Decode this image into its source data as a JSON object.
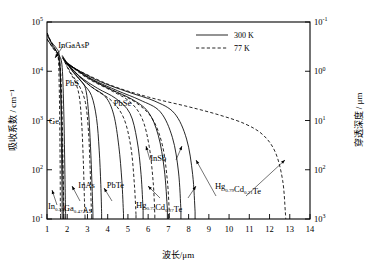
{
  "chart_data": {
    "type": "line",
    "title": "",
    "xlabel": "波长/μm",
    "ylabel": "吸收系数 / cm⁻¹",
    "y2label": "穿透深度 / μm",
    "xlim": [
      1,
      14
    ],
    "ylim": [
      10,
      100000
    ],
    "y2lim": [
      1000,
      0.1
    ],
    "yscale": "log",
    "xscale": "linear",
    "grid": false,
    "xticks": [
      "1",
      "2",
      "3",
      "4",
      "5",
      "6",
      "7",
      "8",
      "9",
      "10",
      "11",
      "12",
      "13",
      "14"
    ],
    "yticks": [
      "10¹",
      "10²",
      "10³",
      "10⁴",
      "10⁵"
    ],
    "yticks_mantissa": [
      "10",
      "10",
      "10",
      "10",
      "10"
    ],
    "yticks_exponent": [
      "1",
      "2",
      "3",
      "4",
      "5"
    ],
    "y2ticks_mantissa": [
      "10",
      "10",
      "10",
      "10",
      "10"
    ],
    "y2ticks_exponent": [
      "-1",
      "0",
      "1",
      "2",
      "3"
    ],
    "legend": {
      "position": "top-right",
      "entries": [
        {
          "label": "300 K",
          "style": "solid"
        },
        {
          "label": "77 K",
          "style": "dashed"
        }
      ]
    },
    "annotations": [
      {
        "label": "InGaAsP",
        "x": 1.55,
        "y": 30000
      },
      {
        "label": "PbS",
        "x": 1.9,
        "y": 5000
      },
      {
        "label": "Ge",
        "x": 1.1,
        "y": 850
      },
      {
        "label": "PbSe",
        "x": 4.3,
        "y": 2000
      },
      {
        "label": "PbTe",
        "x": 3.95,
        "y": 42
      },
      {
        "label": "InAs",
        "x": 2.55,
        "y": 42
      },
      {
        "label": "InSb",
        "x": 6.1,
        "y": 150
      },
      {
        "label": "In₀.₅₃Ga₀.₄₇As",
        "x": 1.05,
        "y": 16
      },
      {
        "label": "Hg₀.₇₃Cd₀.₂₇Te",
        "x": 5.4,
        "y": 17
      },
      {
        "label": "Hg₀.₇₉Cd₀.₂₁Te",
        "x": 9.3,
        "y": 40
      }
    ],
    "series": [
      {
        "name": "In0.53Ga0.47As",
        "temperature": "300 K",
        "style": "solid",
        "points": [
          [
            1.0,
            60000
          ],
          [
            1.2,
            40000
          ],
          [
            1.45,
            30000
          ],
          [
            1.6,
            22000
          ],
          [
            1.66,
            9000
          ],
          [
            1.7,
            1200
          ],
          [
            1.72,
            200
          ],
          [
            1.74,
            40
          ],
          [
            1.75,
            12
          ]
        ]
      },
      {
        "name": "In0.53Ga0.47As",
        "temperature": "77 K",
        "style": "dashed",
        "points": [
          [
            1.0,
            60000
          ],
          [
            1.2,
            40000
          ],
          [
            1.4,
            28000
          ],
          [
            1.55,
            20000
          ],
          [
            1.6,
            6000
          ],
          [
            1.63,
            900
          ],
          [
            1.65,
            120
          ],
          [
            1.66,
            20
          ],
          [
            1.67,
            11
          ]
        ]
      },
      {
        "name": "Ge",
        "temperature": "300 K",
        "style": "solid",
        "points": [
          [
            1.0,
            45000
          ],
          [
            1.3,
            30000
          ],
          [
            1.6,
            21000
          ],
          [
            1.75,
            12000
          ],
          [
            1.83,
            1500
          ],
          [
            1.87,
            200
          ],
          [
            1.9,
            35
          ],
          [
            1.92,
            12
          ]
        ]
      },
      {
        "name": "Ge",
        "temperature": "77 K",
        "style": "dashed",
        "points": [
          [
            1.0,
            45000
          ],
          [
            1.3,
            29000
          ],
          [
            1.55,
            20000
          ],
          [
            1.68,
            9000
          ],
          [
            1.75,
            1200
          ],
          [
            1.79,
            160
          ],
          [
            1.82,
            30
          ],
          [
            1.84,
            11
          ]
        ]
      },
      {
        "name": "InGaAsP",
        "temperature": "300 K",
        "style": "solid",
        "points": [
          [
            1.0,
            55000
          ],
          [
            1.25,
            35000
          ],
          [
            1.5,
            24000
          ],
          [
            1.62,
            14000
          ],
          [
            1.7,
            2500
          ],
          [
            1.75,
            350
          ],
          [
            1.79,
            50
          ],
          [
            1.81,
            13
          ]
        ]
      },
      {
        "name": "PbS",
        "temperature": "300 K",
        "style": "solid",
        "points": [
          [
            1.75,
            21000
          ],
          [
            2.2,
            11000
          ],
          [
            2.6,
            7000
          ],
          [
            2.9,
            4500
          ],
          [
            3.05,
            1500
          ],
          [
            3.15,
            300
          ],
          [
            3.22,
            55
          ],
          [
            3.27,
            13
          ]
        ]
      },
      {
        "name": "PbS",
        "temperature": "77 K",
        "style": "dashed",
        "points": [
          [
            1.75,
            20000
          ],
          [
            2.1,
            10000
          ],
          [
            2.4,
            6000
          ],
          [
            2.6,
            3000
          ],
          [
            2.72,
            800
          ],
          [
            2.8,
            130
          ],
          [
            2.85,
            25
          ],
          [
            2.88,
            11
          ]
        ]
      },
      {
        "name": "InAs",
        "temperature": "300 K",
        "style": "solid",
        "points": [
          [
            1.78,
            19000
          ],
          [
            2.3,
            9500
          ],
          [
            2.8,
            5500
          ],
          [
            3.2,
            3200
          ],
          [
            3.45,
            1100
          ],
          [
            3.58,
            250
          ],
          [
            3.66,
            50
          ],
          [
            3.7,
            13
          ]
        ]
      },
      {
        "name": "InAs",
        "temperature": "77 K",
        "style": "dashed",
        "points": [
          [
            1.78,
            18500
          ],
          [
            2.2,
            9000
          ],
          [
            2.6,
            5000
          ],
          [
            2.9,
            2300
          ],
          [
            3.05,
            600
          ],
          [
            3.13,
            110
          ],
          [
            3.18,
            22
          ],
          [
            3.21,
            11
          ]
        ]
      },
      {
        "name": "PbTe",
        "temperature": "300 K",
        "style": "solid",
        "points": [
          [
            1.8,
            18000
          ],
          [
            2.5,
            8500
          ],
          [
            3.2,
            4800
          ],
          [
            3.9,
            3000
          ],
          [
            4.3,
            1300
          ],
          [
            4.55,
            300
          ],
          [
            4.7,
            60
          ],
          [
            4.78,
            13
          ]
        ]
      },
      {
        "name": "PbSe",
        "temperature": "300 K",
        "style": "solid",
        "points": [
          [
            1.85,
            17000
          ],
          [
            2.6,
            8000
          ],
          [
            3.5,
            4500
          ],
          [
            4.4,
            2800
          ],
          [
            5.1,
            1400
          ],
          [
            5.45,
            400
          ],
          [
            5.65,
            80
          ],
          [
            5.75,
            15
          ]
        ]
      },
      {
        "name": "PbSe",
        "temperature": "77 K",
        "style": "dashed",
        "points": [
          [
            1.85,
            16500
          ],
          [
            2.6,
            7800
          ],
          [
            3.4,
            4200
          ],
          [
            4.2,
            2500
          ],
          [
            4.8,
            1100
          ],
          [
            5.15,
            280
          ],
          [
            5.32,
            50
          ],
          [
            5.4,
            12
          ]
        ]
      },
      {
        "name": "Hg0.73Cd0.27Te",
        "temperature": "300 K",
        "style": "solid",
        "points": [
          [
            1.9,
            16000
          ],
          [
            3.0,
            7500
          ],
          [
            4.2,
            4200
          ],
          [
            5.2,
            2700
          ],
          [
            6.0,
            1500
          ],
          [
            6.5,
            500
          ],
          [
            6.8,
            100
          ],
          [
            6.95,
            16
          ]
        ]
      },
      {
        "name": "Hg0.73Cd0.27Te",
        "temperature": "77 K",
        "style": "dashed",
        "points": [
          [
            1.9,
            15500
          ],
          [
            3.0,
            7200
          ],
          [
            4.2,
            4000
          ],
          [
            5.1,
            2400
          ],
          [
            5.7,
            1100
          ],
          [
            6.05,
            300
          ],
          [
            6.25,
            55
          ],
          [
            6.33,
            12
          ]
        ]
      },
      {
        "name": "InSb",
        "temperature": "300 K",
        "style": "solid",
        "points": [
          [
            1.95,
            15000
          ],
          [
            3.2,
            7000
          ],
          [
            4.5,
            4000
          ],
          [
            5.6,
            2600
          ],
          [
            6.6,
            1500
          ],
          [
            7.2,
            450
          ],
          [
            7.5,
            90
          ],
          [
            7.62,
            15
          ]
        ]
      },
      {
        "name": "InSb",
        "temperature": "77 K",
        "style": "dashed",
        "points": [
          [
            1.95,
            14500
          ],
          [
            3.2,
            6800
          ],
          [
            4.4,
            3800
          ],
          [
            5.4,
            2300
          ],
          [
            6.2,
            1100
          ],
          [
            6.7,
            320
          ],
          [
            6.95,
            60
          ],
          [
            7.05,
            12
          ]
        ]
      },
      {
        "name": "Hg0.79Cd0.21Te",
        "temperature": "300 K",
        "style": "solid",
        "points": [
          [
            2.0,
            14000
          ],
          [
            3.5,
            6500
          ],
          [
            5.0,
            3800
          ],
          [
            6.3,
            2500
          ],
          [
            7.3,
            1400
          ],
          [
            7.9,
            420
          ],
          [
            8.2,
            80
          ],
          [
            8.32,
            14
          ]
        ]
      },
      {
        "name": "Hg0.79Cd0.21Te",
        "temperature": "77 K",
        "style": "dashed",
        "points": [
          [
            2.0,
            13500
          ],
          [
            4.0,
            5500
          ],
          [
            6.0,
            3000
          ],
          [
            8.0,
            1900
          ],
          [
            9.5,
            1300
          ],
          [
            10.8,
            850
          ],
          [
            11.7,
            500
          ],
          [
            12.3,
            220
          ],
          [
            12.65,
            60
          ],
          [
            12.78,
            14
          ],
          [
            12.8,
            10
          ]
        ]
      }
    ]
  }
}
